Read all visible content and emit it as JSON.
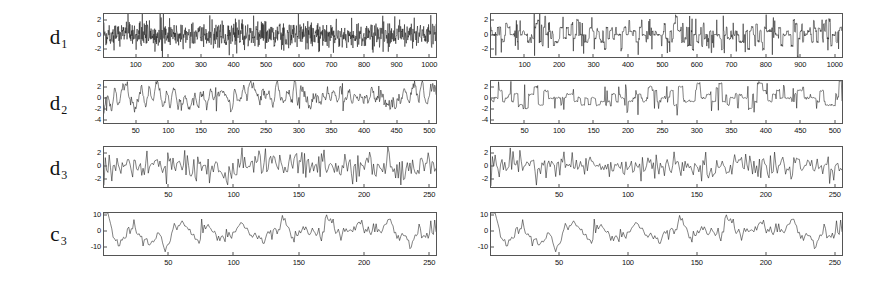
{
  "figure": {
    "background_color": "#ffffff",
    "trace_color": "#1a1a1a",
    "axis_color": "#555555",
    "panels": [
      {
        "name": "left-panel",
        "position": "left",
        "rows": [
          {
            "label": "d",
            "subscript": "1"
          },
          {
            "label": "d",
            "subscript": "2"
          },
          {
            "label": "d",
            "subscript": "3"
          },
          {
            "label": "c",
            "subscript": "3"
          }
        ]
      },
      {
        "name": "right-panel",
        "position": "right",
        "rows": [
          {
            "label": "d",
            "subscript": "1"
          },
          {
            "label": "d",
            "subscript": "2"
          },
          {
            "label": "d",
            "subscript": "3"
          },
          {
            "label": "c",
            "subscript": "3"
          }
        ]
      }
    ]
  },
  "chart_data": [
    {
      "id": "left-d1",
      "type": "line",
      "panel": "left",
      "row": 0,
      "title": "",
      "series_label": "d1",
      "xlabel": "",
      "ylabel": "",
      "xlim": [
        0,
        1024
      ],
      "ylim": [
        -3.2,
        3.0
      ],
      "xticks": [
        100,
        200,
        300,
        400,
        500,
        600,
        700,
        800,
        900,
        1000
      ],
      "yticks": [
        2,
        0,
        -2
      ],
      "grid": false,
      "legend": "none",
      "n_points": 1024,
      "description": "Level-1 wavelet detail coefficients, dense high-frequency noise",
      "seed": 11,
      "gen": {
        "kind": "noise",
        "amp": 0.95,
        "spikes": 0.02,
        "spike_amp": 2.6
      }
    },
    {
      "id": "left-d2",
      "type": "line",
      "panel": "left",
      "row": 1,
      "title": "",
      "series_label": "d2",
      "xlabel": "",
      "ylabel": "",
      "xlim": [
        0,
        512
      ],
      "ylim": [
        -4.8,
        3.2
      ],
      "xticks": [
        50,
        100,
        150,
        200,
        250,
        300,
        350,
        400,
        450,
        500
      ],
      "yticks": [
        2,
        0,
        -2,
        -4
      ],
      "grid": false,
      "legend": "none",
      "n_points": 512,
      "description": "Level-2 wavelet detail coefficients, smoother correlated noise",
      "seed": 23,
      "gen": {
        "kind": "smooth-noise",
        "amp": 1.25,
        "smooth": 2,
        "spikes": 0.02,
        "spike_amp": 2.4
      }
    },
    {
      "id": "left-d3",
      "type": "line",
      "panel": "left",
      "row": 2,
      "title": "",
      "series_label": "d3",
      "xlabel": "",
      "ylabel": "",
      "xlim": [
        0,
        256
      ],
      "ylim": [
        -3.4,
        3.0
      ],
      "xticks": [
        50,
        100,
        150,
        200,
        250
      ],
      "yticks": [
        2,
        0,
        -2
      ],
      "grid": false,
      "legend": "none",
      "n_points": 256,
      "description": "Level-3 wavelet detail coefficients",
      "seed": 37,
      "gen": {
        "kind": "noise",
        "amp": 1.0,
        "spikes": 0.03,
        "spike_amp": 2.6
      }
    },
    {
      "id": "left-c3",
      "type": "line",
      "panel": "left",
      "row": 3,
      "title": "",
      "series_label": "c3",
      "xlabel": "",
      "ylabel": "",
      "xlim": [
        0,
        256
      ],
      "ylim": [
        -16,
        12
      ],
      "xticks": [
        50,
        100,
        150,
        200,
        250
      ],
      "yticks": [
        10,
        0,
        -10
      ],
      "grid": false,
      "legend": "none",
      "n_points": 256,
      "description": "Level-3 wavelet approximation coefficients, low-frequency trend",
      "seed": 59,
      "gen": {
        "kind": "smooth-noise",
        "amp": 5.5,
        "smooth": 3,
        "spikes": 0.015,
        "spike_amp": 7.0
      }
    },
    {
      "id": "right-d1",
      "type": "line",
      "panel": "right",
      "row": 0,
      "title": "",
      "series_label": "d1",
      "xlabel": "",
      "ylabel": "",
      "xlim": [
        0,
        1024
      ],
      "ylim": [
        -3.2,
        3.0
      ],
      "xticks": [
        100,
        200,
        300,
        400,
        500,
        600,
        700,
        800,
        900,
        1000
      ],
      "yticks": [
        2,
        0,
        -2
      ],
      "grid": false,
      "legend": "none",
      "n_points": 1024,
      "description": "Level-1 detail coefficients after thresholding, blocky/quantized",
      "seed": 71,
      "gen": {
        "kind": "blocky",
        "amp": 0.95,
        "block": 3,
        "spikes": 0.03,
        "spike_amp": 2.6
      }
    },
    {
      "id": "right-d2",
      "type": "line",
      "panel": "right",
      "row": 1,
      "title": "",
      "series_label": "d2",
      "xlabel": "",
      "ylabel": "",
      "xlim": [
        0,
        512
      ],
      "ylim": [
        -4.8,
        3.2
      ],
      "xticks": [
        50,
        100,
        150,
        200,
        250,
        300,
        350,
        400,
        450,
        500
      ],
      "yticks": [
        2,
        0,
        -2,
        -4
      ],
      "grid": false,
      "legend": "none",
      "n_points": 512,
      "description": "Level-2 detail coefficients after thresholding, square-wave plateaus",
      "seed": 83,
      "gen": {
        "kind": "blocky",
        "amp": 1.25,
        "block": 4,
        "spikes": 0.025,
        "spike_amp": 2.8
      }
    },
    {
      "id": "right-d3",
      "type": "line",
      "panel": "right",
      "row": 2,
      "title": "",
      "series_label": "d3",
      "xlabel": "",
      "ylabel": "",
      "xlim": [
        0,
        256
      ],
      "ylim": [
        -3.4,
        3.0
      ],
      "xticks": [
        50,
        100,
        150,
        200,
        250
      ],
      "yticks": [
        2,
        0,
        -2
      ],
      "grid": false,
      "legend": "none",
      "n_points": 256,
      "description": "Level-3 detail coefficients after thresholding",
      "seed": 97,
      "gen": {
        "kind": "noise",
        "amp": 1.0,
        "spikes": 0.03,
        "spike_amp": 2.6
      }
    },
    {
      "id": "right-c3",
      "type": "line",
      "panel": "right",
      "row": 3,
      "title": "",
      "series_label": "c3",
      "xlabel": "",
      "ylabel": "",
      "xlim": [
        0,
        256
      ],
      "ylim": [
        -16,
        12
      ],
      "xticks": [
        50,
        100,
        150,
        200,
        250
      ],
      "yticks": [
        10,
        0,
        -10
      ],
      "grid": false,
      "legend": "none",
      "n_points": 256,
      "description": "Level-3 approximation coefficients, low-frequency trend (same as left)",
      "seed": 59,
      "gen": {
        "kind": "smooth-noise",
        "amp": 5.5,
        "smooth": 3,
        "spikes": 0.015,
        "spike_amp": 7.0
      }
    }
  ]
}
